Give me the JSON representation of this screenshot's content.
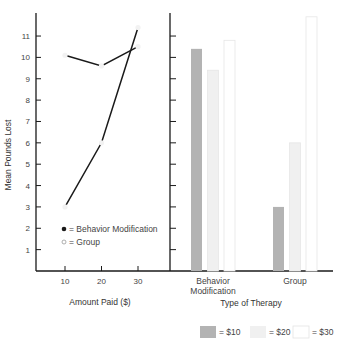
{
  "chart_data": [
    {
      "type": "line",
      "title": "",
      "xlabel": "Amount Paid ($)",
      "ylabel": "Mean Pounds Lost",
      "x": [
        10,
        20,
        30
      ],
      "xticks": [
        "10",
        "20",
        "30"
      ],
      "yticks": [
        "1",
        "2",
        "3",
        "4",
        "5",
        "6",
        "7",
        "8",
        "9",
        "10",
        "11"
      ],
      "ylim": [
        0,
        12
      ],
      "grid": false,
      "legend_position": "inside lower center",
      "series": [
        {
          "name": "Behavior Modification",
          "marker": "filled-circle",
          "values": [
            3.0,
            6.0,
            11.4
          ]
        },
        {
          "name": "Group",
          "marker": "open-circle",
          "values": [
            10.1,
            9.6,
            10.5
          ]
        }
      ]
    },
    {
      "type": "bar",
      "title": "",
      "xlabel": "Type of Therapy",
      "ylabel": "Mean Pounds Lost",
      "categories": [
        "Behavior Modification",
        "Group"
      ],
      "ylim": [
        0,
        12
      ],
      "grid": false,
      "legend_position": "bottom right",
      "series": [
        {
          "name": "= $10",
          "color": "#b3b3b3",
          "values": [
            10.4,
            3.0
          ]
        },
        {
          "name": "= $20",
          "color": "#f0f0f0",
          "values": [
            9.4,
            6.0
          ]
        },
        {
          "name": "= $30",
          "color": "#ffffff",
          "values": [
            10.8,
            11.9
          ]
        }
      ]
    }
  ],
  "labels": {
    "ylabel": "Mean Pounds Lost",
    "left_xlabel": "Amount Paid ($)",
    "right_xlabel": "Type of Therapy",
    "cat1_line1": "Behavior",
    "cat1_line2": "Modification",
    "cat2": "Group",
    "legend_bm": "= Behavior Modification",
    "legend_group": "= Group",
    "legend_10": "= $10",
    "legend_20": "= $20",
    "legend_30": "= $30"
  },
  "colors": {
    "axis": "#1a1a1a",
    "bar10": "#b3b3b3",
    "bar20": "#f0f0f0",
    "bar30": "#ffffff",
    "bar_stroke": "#e6e6e6",
    "line": "#1a1a1a"
  }
}
